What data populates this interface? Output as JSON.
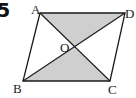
{
  "problem_number": "5",
  "figure": {
    "type": "parallelogram-with-diagonals",
    "points": {
      "A": {
        "label": "A",
        "x": 40,
        "y": 13
      },
      "B": {
        "label": "B",
        "x": 23,
        "y": 81
      },
      "C": {
        "label": "C",
        "x": 110,
        "y": 81
      },
      "D": {
        "label": "D",
        "x": 125,
        "y": 13
      },
      "O": {
        "label": "O",
        "x": 74,
        "y": 47
      }
    },
    "shaded_regions": [
      "AOD",
      "BOC"
    ],
    "shade_color": "#cfcfcf",
    "line_color": "#1a1a1a"
  }
}
